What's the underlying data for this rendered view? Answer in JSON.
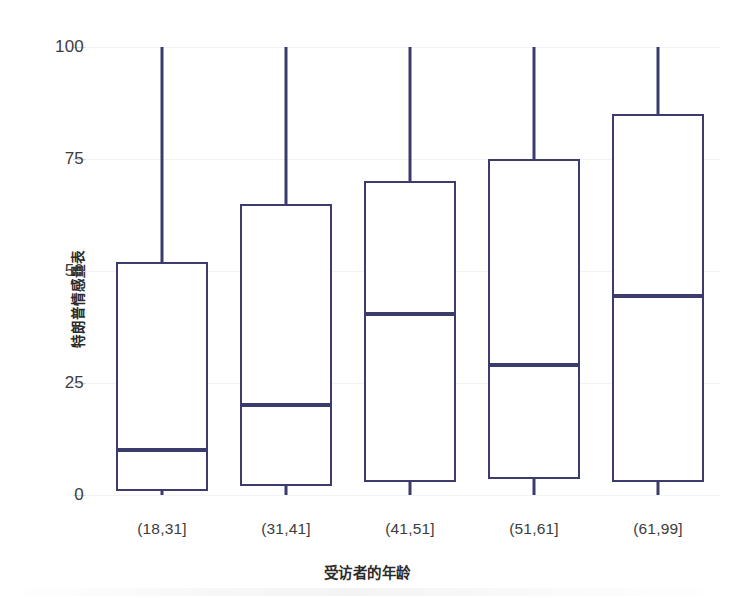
{
  "chart_data": {
    "type": "box",
    "title": "",
    "xlabel": "受访者的年龄",
    "ylabel": "特朗普情感量表",
    "categories": [
      "(18,31]",
      "(31,41]",
      "(41,51]",
      "(51,61]",
      "(61,99]"
    ],
    "ylim": [
      0,
      100
    ],
    "yticks": [
      0,
      25,
      50,
      75,
      100
    ],
    "ytick_labels": [
      "0",
      "25",
      "50",
      "75",
      "100"
    ],
    "grid": true,
    "legend": "none",
    "box_color": "#3b3b6d",
    "box_fill": "#ffffff",
    "grid_color": "#f2f2f4",
    "boxes": [
      {
        "category": "(18,31]",
        "whisker_low": 0,
        "q1": 1,
        "median": 10,
        "q3": 52,
        "whisker_high": 100
      },
      {
        "category": "(31,41]",
        "whisker_low": 0,
        "q1": 2,
        "median": 20,
        "q3": 65,
        "whisker_high": 100
      },
      {
        "category": "(41,51]",
        "whisker_low": 0,
        "q1": 3,
        "median": 40.5,
        "q3": 70,
        "whisker_high": 100
      },
      {
        "category": "(51,61]",
        "whisker_low": 0,
        "q1": 3.5,
        "median": 29,
        "q3": 75,
        "whisker_high": 100
      },
      {
        "category": "(61,99]",
        "whisker_low": 0,
        "q1": 3,
        "median": 44.5,
        "q3": 85,
        "whisker_high": 100
      }
    ]
  }
}
